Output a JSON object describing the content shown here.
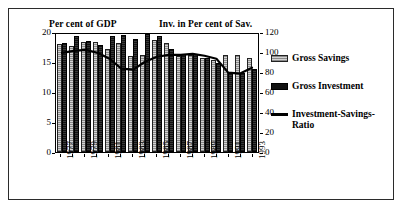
{
  "header": {
    "left_title": "Per cent of GDP",
    "right_title": "Inv. in Per cent of Sav."
  },
  "legend": {
    "items": [
      {
        "label": "Gross Savings",
        "swatch": "savings-swatch"
      },
      {
        "label": "Gross Investment",
        "swatch": "investment-swatch"
      },
      {
        "label": "Investment-Savings-Ratio",
        "swatch": "ratio-line-swatch"
      }
    ]
  },
  "chart_data": {
    "type": "bar",
    "title": "",
    "subtitle": "",
    "xlabel": "",
    "ylabel": "Per cent of GDP",
    "y2label": "Inv. in Per cent of Sav.",
    "ylim": [
      0,
      20
    ],
    "y2lim": [
      0,
      120
    ],
    "yticks": [
      0,
      5,
      10,
      15,
      20
    ],
    "y2ticks": [
      0,
      20,
      40,
      60,
      80,
      100,
      120
    ],
    "grid": false,
    "legend_position": "right",
    "categories": [
      "1977",
      "1978",
      "1979",
      "1980",
      "1981",
      "1982",
      "1983",
      "1984",
      "1985",
      "1986",
      "1987",
      "1988",
      "1989",
      "1990",
      "1991",
      "1992",
      "1993"
    ],
    "xtick_labels": [
      "1977",
      "",
      "1979",
      "",
      "1981",
      "",
      "1983",
      "",
      "1985",
      "",
      "1987",
      "",
      "1989",
      "",
      "1991",
      "",
      "1993"
    ],
    "series": [
      {
        "name": "Gross Savings",
        "axis": "left",
        "values": [
          18.0,
          17.6,
          18.3,
          18.4,
          17.2,
          18.2,
          16.0,
          16.1,
          18.6,
          18.2,
          16.0,
          16.2,
          15.6,
          15.4,
          16.2,
          16.2,
          15.7
        ]
      },
      {
        "name": "Gross Investment",
        "axis": "left",
        "values": [
          18.1,
          19.3,
          18.5,
          17.8,
          19.3,
          19.5,
          18.8,
          19.6,
          19.3,
          17.1,
          16.3,
          16.3,
          15.6,
          14.9,
          13.1,
          13.1,
          13.9
        ]
      },
      {
        "name": "Investment-Savings-Ratio",
        "axis": "right",
        "values": [
          101,
          103,
          104,
          101,
          95,
          85,
          84,
          92,
          97,
          99,
          99,
          100,
          98,
          95,
          81,
          80,
          86
        ]
      }
    ]
  }
}
